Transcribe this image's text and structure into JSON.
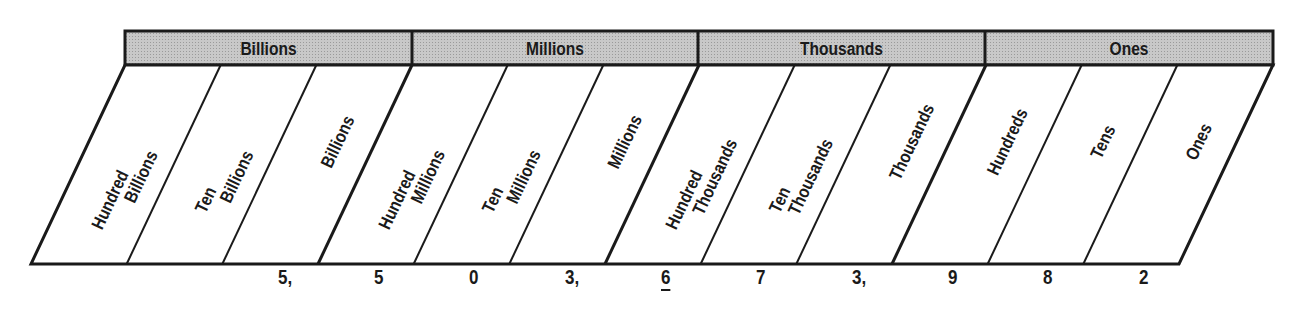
{
  "diagram": {
    "type": "place-value-chart",
    "groups": [
      {
        "label": "Billions"
      },
      {
        "label": "Millions"
      },
      {
        "label": "Thousands"
      },
      {
        "label": "Ones"
      }
    ],
    "columns": [
      {
        "line1": "Hundred",
        "line2": "Billions"
      },
      {
        "line1": "Ten",
        "line2": "Billions"
      },
      {
        "line1": "",
        "line2": "Billions"
      },
      {
        "line1": "Hundred",
        "line2": "Millions"
      },
      {
        "line1": "Ten",
        "line2": "Millions"
      },
      {
        "line1": "",
        "line2": "Millions"
      },
      {
        "line1": "Hundred",
        "line2": "Thousands"
      },
      {
        "line1": "Ten",
        "line2": "Thousands"
      },
      {
        "line1": "",
        "line2": "Thousands"
      },
      {
        "line1": "",
        "line2": "Hundreds"
      },
      {
        "line1": "",
        "line2": "Tens"
      },
      {
        "line1": "",
        "line2": "Ones"
      }
    ],
    "digits": [
      {
        "text": "",
        "underlined": false
      },
      {
        "text": "",
        "underlined": false
      },
      {
        "text": "5,",
        "underlined": false
      },
      {
        "text": "5",
        "underlined": false
      },
      {
        "text": "0",
        "underlined": false
      },
      {
        "text": "3,",
        "underlined": false
      },
      {
        "text": "6",
        "underlined": true
      },
      {
        "text": "7",
        "underlined": false
      },
      {
        "text": "3,",
        "underlined": false
      },
      {
        "text": "9",
        "underlined": false
      },
      {
        "text": "8",
        "underlined": false
      },
      {
        "text": "2",
        "underlined": false
      }
    ],
    "number": "5,503,673,982",
    "highlighted_digit": {
      "value": "6",
      "place": "Hundred Thousands"
    },
    "colors": {
      "header_fill": "#bdbdbd",
      "line": "#1a1a1a",
      "background": "#ffffff"
    }
  }
}
